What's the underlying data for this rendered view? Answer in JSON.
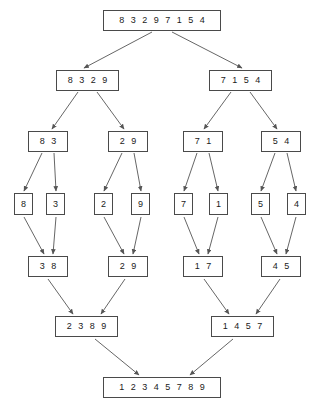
{
  "diagram": {
    "colors": {
      "box_border": "#4a4a4a",
      "arrow": "#555555",
      "text": "#1a1a1a",
      "background": "#ffffff"
    },
    "levels": [
      {
        "name": "root",
        "role": "unsorted-input",
        "nodes": [
          {
            "id": "n0",
            "label": "8 3 2 9 7 1 5 4",
            "x": 103,
            "y": 10,
            "w": 118,
            "h": 21
          }
        ]
      },
      {
        "name": "split-1",
        "role": "split",
        "nodes": [
          {
            "id": "n1",
            "label": "8 3 2 9",
            "x": 56,
            "y": 70,
            "w": 63,
            "h": 21
          },
          {
            "id": "n2",
            "label": "7 1 5 4",
            "x": 209,
            "y": 70,
            "w": 63,
            "h": 21
          }
        ]
      },
      {
        "name": "split-2",
        "role": "split",
        "nodes": [
          {
            "id": "n3",
            "label": "8 3",
            "x": 28,
            "y": 131,
            "w": 40,
            "h": 21
          },
          {
            "id": "n4",
            "label": "2 9",
            "x": 108,
            "y": 131,
            "w": 40,
            "h": 21
          },
          {
            "id": "n5",
            "label": "7 1",
            "x": 183,
            "y": 131,
            "w": 40,
            "h": 21
          },
          {
            "id": "n6",
            "label": "5 4",
            "x": 261,
            "y": 131,
            "w": 40,
            "h": 21
          }
        ]
      },
      {
        "name": "leaves",
        "role": "single-elements",
        "nodes": [
          {
            "id": "n7",
            "label": "8",
            "x": 14,
            "y": 193,
            "w": 19,
            "h": 22
          },
          {
            "id": "n8",
            "label": "3",
            "x": 46,
            "y": 193,
            "w": 19,
            "h": 22
          },
          {
            "id": "n9",
            "label": "2",
            "x": 94,
            "y": 193,
            "w": 19,
            "h": 22
          },
          {
            "id": "n10",
            "label": "9",
            "x": 131,
            "y": 193,
            "w": 19,
            "h": 22
          },
          {
            "id": "n11",
            "label": "7",
            "x": 174,
            "y": 193,
            "w": 19,
            "h": 22
          },
          {
            "id": "n12",
            "label": "1",
            "x": 209,
            "y": 193,
            "w": 19,
            "h": 22
          },
          {
            "id": "n13",
            "label": "5",
            "x": 251,
            "y": 193,
            "w": 19,
            "h": 22
          },
          {
            "id": "n14",
            "label": "4",
            "x": 287,
            "y": 193,
            "w": 19,
            "h": 22
          }
        ]
      },
      {
        "name": "merge-1",
        "role": "merge",
        "nodes": [
          {
            "id": "n15",
            "label": "3 8",
            "x": 28,
            "y": 256,
            "w": 40,
            "h": 21
          },
          {
            "id": "n16",
            "label": "2 9",
            "x": 108,
            "y": 256,
            "w": 40,
            "h": 21
          },
          {
            "id": "n17",
            "label": "1 7",
            "x": 183,
            "y": 256,
            "w": 40,
            "h": 21
          },
          {
            "id": "n18",
            "label": "4 5",
            "x": 261,
            "y": 256,
            "w": 40,
            "h": 21
          }
        ]
      },
      {
        "name": "merge-2",
        "role": "merge",
        "nodes": [
          {
            "id": "n19",
            "label": "2 3 8 9",
            "x": 55,
            "y": 316,
            "w": 63,
            "h": 21
          },
          {
            "id": "n20",
            "label": "1 4 5 7",
            "x": 211,
            "y": 316,
            "w": 63,
            "h": 21
          }
        ]
      },
      {
        "name": "result",
        "role": "sorted-output",
        "nodes": [
          {
            "id": "n21",
            "label": "1 2 3 4 5 7 8 9",
            "x": 103,
            "y": 377,
            "w": 118,
            "h": 21
          }
        ]
      }
    ],
    "edges": [
      {
        "from": "n0",
        "to": "n1",
        "x1": 152,
        "y1": 32,
        "x2": 84,
        "y2": 68
      },
      {
        "from": "n0",
        "to": "n2",
        "x1": 172,
        "y1": 32,
        "x2": 242,
        "y2": 68
      },
      {
        "from": "n1",
        "to": "n3",
        "x1": 78,
        "y1": 92,
        "x2": 52,
        "y2": 129
      },
      {
        "from": "n1",
        "to": "n4",
        "x1": 97,
        "y1": 92,
        "x2": 124,
        "y2": 129
      },
      {
        "from": "n2",
        "to": "n5",
        "x1": 231,
        "y1": 92,
        "x2": 204,
        "y2": 129
      },
      {
        "from": "n2",
        "to": "n6",
        "x1": 250,
        "y1": 92,
        "x2": 277,
        "y2": 129
      },
      {
        "from": "n3",
        "to": "n7",
        "x1": 42,
        "y1": 153,
        "x2": 24,
        "y2": 191
      },
      {
        "from": "n3",
        "to": "n8",
        "x1": 54,
        "y1": 153,
        "x2": 56,
        "y2": 191
      },
      {
        "from": "n4",
        "to": "n9",
        "x1": 122,
        "y1": 153,
        "x2": 104,
        "y2": 191
      },
      {
        "from": "n4",
        "to": "n10",
        "x1": 134,
        "y1": 153,
        "x2": 141,
        "y2": 191
      },
      {
        "from": "n5",
        "to": "n11",
        "x1": 197,
        "y1": 153,
        "x2": 184,
        "y2": 191
      },
      {
        "from": "n5",
        "to": "n12",
        "x1": 209,
        "y1": 153,
        "x2": 218,
        "y2": 191
      },
      {
        "from": "n6",
        "to": "n13",
        "x1": 275,
        "y1": 153,
        "x2": 261,
        "y2": 191
      },
      {
        "from": "n6",
        "to": "n14",
        "x1": 287,
        "y1": 153,
        "x2": 296,
        "y2": 191
      },
      {
        "from": "n7",
        "to": "n15",
        "x1": 24,
        "y1": 217,
        "x2": 44,
        "y2": 254
      },
      {
        "from": "n8",
        "to": "n15",
        "x1": 56,
        "y1": 217,
        "x2": 53,
        "y2": 254
      },
      {
        "from": "n9",
        "to": "n16",
        "x1": 104,
        "y1": 217,
        "x2": 124,
        "y2": 254
      },
      {
        "from": "n10",
        "to": "n16",
        "x1": 141,
        "y1": 217,
        "x2": 133,
        "y2": 254
      },
      {
        "from": "n11",
        "to": "n17",
        "x1": 184,
        "y1": 217,
        "x2": 199,
        "y2": 254
      },
      {
        "from": "n12",
        "to": "n17",
        "x1": 218,
        "y1": 217,
        "x2": 208,
        "y2": 254
      },
      {
        "from": "n13",
        "to": "n18",
        "x1": 261,
        "y1": 217,
        "x2": 277,
        "y2": 254
      },
      {
        "from": "n14",
        "to": "n18",
        "x1": 296,
        "y1": 217,
        "x2": 286,
        "y2": 254
      },
      {
        "from": "n15",
        "to": "n19",
        "x1": 48,
        "y1": 279,
        "x2": 73,
        "y2": 314
      },
      {
        "from": "n16",
        "to": "n19",
        "x1": 125,
        "y1": 279,
        "x2": 101,
        "y2": 314
      },
      {
        "from": "n17",
        "to": "n20",
        "x1": 204,
        "y1": 279,
        "x2": 229,
        "y2": 314
      },
      {
        "from": "n18",
        "to": "n20",
        "x1": 280,
        "y1": 279,
        "x2": 256,
        "y2": 314
      },
      {
        "from": "n19",
        "to": "n21",
        "x1": 95,
        "y1": 339,
        "x2": 139,
        "y2": 375
      },
      {
        "from": "n20",
        "to": "n21",
        "x1": 233,
        "y1": 339,
        "x2": 190,
        "y2": 375
      }
    ]
  }
}
